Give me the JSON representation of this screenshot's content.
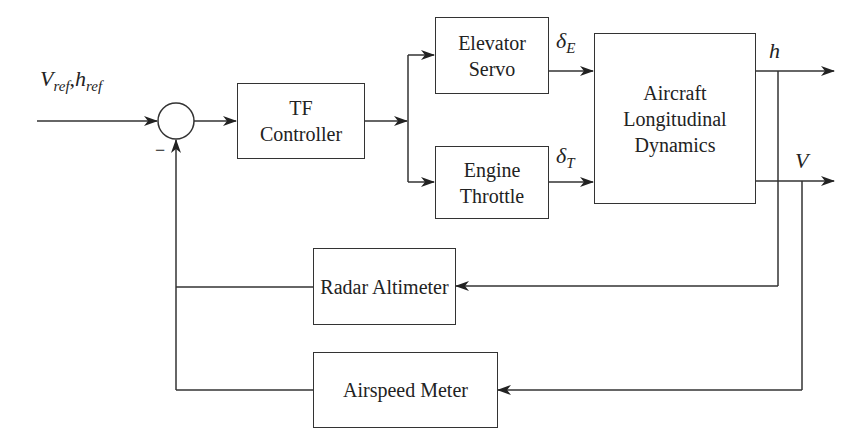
{
  "diagram": {
    "type": "block-diagram",
    "input": {
      "label_v": "V",
      "label_v_sub": "ref",
      "sep": ",",
      "label_h": "h",
      "label_h_sub": "ref"
    },
    "summing_junction": {
      "feedback_sign": "−"
    },
    "blocks": {
      "controller": {
        "line1": "TF",
        "line2": "Controller"
      },
      "elevator": {
        "line1": "Elevator",
        "line2": "Servo"
      },
      "throttle": {
        "line1": "Engine",
        "line2": "Throttle"
      },
      "plant": {
        "line1": "Aircraft",
        "line2": "Longitudinal",
        "line3": "Dynamics"
      },
      "radar": {
        "line1": "Radar Altimeter"
      },
      "airspeed": {
        "line1": "Airspeed Meter"
      }
    },
    "signals": {
      "delta_e": {
        "sym": "δ",
        "sub": "E"
      },
      "delta_t": {
        "sym": "δ",
        "sub": "T"
      },
      "h": "h",
      "v": "V"
    },
    "colors": {
      "stroke": "#333333",
      "background": "#ffffff"
    }
  }
}
